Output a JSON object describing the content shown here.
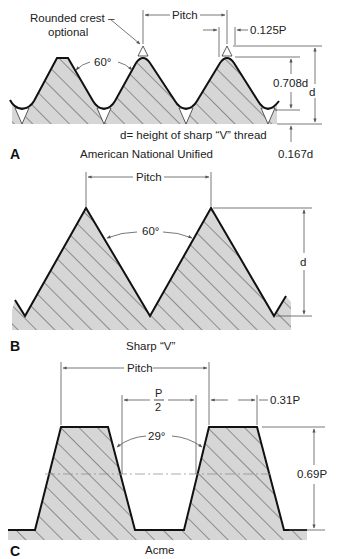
{
  "figure": {
    "colors": {
      "profile": "#111111",
      "fill": "#d6d6d6",
      "hatch": "#333333",
      "dimension": "#555555",
      "background": "#ffffff"
    }
  },
  "panels": {
    "a": {
      "letter": "A",
      "caption": "American National Unified",
      "note": "d= height of sharp “V” thread",
      "callout_line1": "Rounded crest –",
      "callout_line2": "optional",
      "angle": "60°",
      "pitch": "Pitch",
      "flat": "0.125P",
      "depth": "0.708d",
      "height": "d",
      "root": "0.167d"
    },
    "b": {
      "letter": "B",
      "caption": "Sharp “V”",
      "angle": "60°",
      "pitch": "Pitch",
      "height": "d"
    },
    "c": {
      "letter": "C",
      "caption": "Acme",
      "angle": "29°",
      "pitch": "Pitch",
      "half_pitch_num": "P",
      "half_pitch_den": "2",
      "flat": "0.31P",
      "depth": "0.69P"
    }
  }
}
